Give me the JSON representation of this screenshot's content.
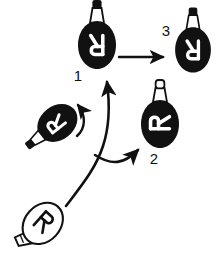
{
  "figure": {
    "title": "",
    "background_color": "#ffffff",
    "ink_color": "#111111",
    "width": 222,
    "height": 262
  },
  "labels": {
    "step_1": "1",
    "step_2": "2",
    "step_3": "3"
  },
  "objects": {
    "source_bulb": {
      "name": "outlined-bulb-source",
      "letter": "R",
      "letter_color": "#111111",
      "body_fill": "#ffffff",
      "orientation": "tilted-diagonal",
      "position": {
        "x": 44,
        "y": 222
      }
    },
    "rotating_bulb": {
      "name": "tilted-solid-bulb-rotating",
      "letter": "R",
      "letter_color": "#ffffff",
      "body_fill": "#111111",
      "orientation": "rotated-left",
      "position": {
        "x": 56,
        "y": 124
      }
    },
    "bulb_one": {
      "name": "solid-bulb-upright-one",
      "letter": "R",
      "letter_color": "#ffffff",
      "body_fill": "#111111",
      "orientation": "mirrored-upright",
      "position": {
        "x": 97,
        "y": 43
      }
    },
    "bulb_two": {
      "name": "solid-bulb-upright-two",
      "letter": "R",
      "letter_color": "#ffffff",
      "body_fill": "#111111",
      "orientation": "rotated-quarter",
      "position": {
        "x": 160,
        "y": 122
      }
    },
    "bulb_three": {
      "name": "solid-bulb-upright-three",
      "letter": "R",
      "letter_color": "#ffffff",
      "body_fill": "#111111",
      "orientation": "mirrored-upright",
      "position": {
        "x": 193,
        "y": 48
      }
    }
  },
  "connectors": {
    "branch_to_one": {
      "name": "curved-arrow-to-bulb-one"
    },
    "branch_to_two": {
      "name": "curved-arrow-to-bulb-two"
    },
    "one_to_three": {
      "name": "straight-arrow-one-to-three"
    },
    "rotation": {
      "name": "curved-rotation-arrow"
    }
  }
}
